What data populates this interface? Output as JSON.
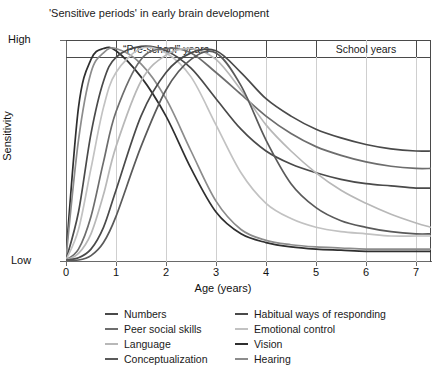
{
  "title": "'Sensitive periods' in early brain development",
  "axes": {
    "x_title": "Age (years)",
    "y_title": "Sensitivity",
    "y_high_label": "High",
    "y_low_label": "Low",
    "x_ticks": [
      "0",
      "1",
      "2",
      "3",
      "4",
      "5",
      "6",
      "7"
    ]
  },
  "bands": [
    {
      "label": "“Pre-school” years",
      "start": 1,
      "end": 3
    },
    {
      "label": "School years",
      "start": 5,
      "end": 7
    }
  ],
  "legend": {
    "left": [
      {
        "label": "Numbers",
        "color": "#4a4a4a"
      },
      {
        "label": "Peer social skills",
        "color": "#6d6d6d"
      },
      {
        "label": "Language",
        "color": "#b8b8b8"
      },
      {
        "label": "Conceptualization",
        "color": "#5a5a5a"
      }
    ],
    "right": [
      {
        "label": "Habitual ways of responding",
        "color": "#4a4a4a"
      },
      {
        "label": "Emotional control",
        "color": "#c2c2c2"
      },
      {
        "label": "Vision",
        "color": "#2f2f2f"
      },
      {
        "label": "Hearing",
        "color": "#8c8c8c"
      }
    ]
  },
  "chart_data": {
    "type": "line",
    "title": "'Sensitive periods' in early brain development",
    "xlabel": "Age (years)",
    "ylabel": "Sensitivity",
    "xlim": [
      0,
      7.3
    ],
    "ylim": [
      0,
      1
    ],
    "x_ticks": [
      0,
      1,
      2,
      3,
      4,
      5,
      6,
      7
    ],
    "y_ticks": [
      0,
      1
    ],
    "y_tick_labels": [
      "Low",
      "High"
    ],
    "grid": "vertical",
    "legend_position": "below-plot",
    "annotations": [
      {
        "text": "“Pre-school” years",
        "x_range": [
          1,
          3
        ],
        "y": 1.0
      },
      {
        "text": "School years",
        "x_range": [
          5,
          7
        ],
        "y": 1.0
      }
    ],
    "x": [
      0,
      0.25,
      0.5,
      0.75,
      1,
      1.5,
      2,
      2.5,
      3,
      3.5,
      4,
      4.5,
      5,
      5.5,
      6,
      6.5,
      7,
      7.3
    ],
    "series": [
      {
        "name": "Vision",
        "color": "#2f2f2f",
        "values": [
          0.02,
          0.7,
          0.92,
          0.97,
          0.96,
          0.84,
          0.66,
          0.42,
          0.22,
          0.12,
          0.08,
          0.06,
          0.05,
          0.045,
          0.04,
          0.04,
          0.04,
          0.04
        ]
      },
      {
        "name": "Hearing",
        "color": "#8c8c8c",
        "values": [
          0.01,
          0.55,
          0.86,
          0.95,
          0.97,
          0.9,
          0.74,
          0.5,
          0.27,
          0.14,
          0.09,
          0.07,
          0.06,
          0.055,
          0.05,
          0.05,
          0.05,
          0.05
        ]
      },
      {
        "name": "Habitual ways of responding",
        "color": "#4a4a4a",
        "values": [
          0.0,
          0.22,
          0.58,
          0.82,
          0.93,
          0.98,
          0.96,
          0.88,
          0.74,
          0.6,
          0.5,
          0.44,
          0.4,
          0.37,
          0.35,
          0.34,
          0.33,
          0.33
        ]
      },
      {
        "name": "Emotional control",
        "color": "#c2c2c2",
        "values": [
          0.0,
          0.14,
          0.42,
          0.7,
          0.86,
          0.97,
          0.95,
          0.84,
          0.62,
          0.4,
          0.26,
          0.19,
          0.15,
          0.13,
          0.12,
          0.11,
          0.11,
          0.11
        ]
      },
      {
        "name": "Peer social skills",
        "color": "#6d6d6d",
        "values": [
          0.0,
          0.05,
          0.2,
          0.45,
          0.68,
          0.92,
          0.97,
          0.95,
          0.86,
          0.76,
          0.66,
          0.58,
          0.52,
          0.48,
          0.45,
          0.43,
          0.42,
          0.42
        ]
      },
      {
        "name": "Language",
        "color": "#b8b8b8",
        "values": [
          0.0,
          0.03,
          0.12,
          0.3,
          0.52,
          0.82,
          0.94,
          0.97,
          0.92,
          0.78,
          0.62,
          0.5,
          0.4,
          0.32,
          0.26,
          0.21,
          0.17,
          0.15
        ]
      },
      {
        "name": "Numbers",
        "color": "#4a4a4a",
        "values": [
          0.0,
          0.01,
          0.05,
          0.15,
          0.32,
          0.66,
          0.86,
          0.95,
          0.96,
          0.86,
          0.74,
          0.66,
          0.6,
          0.56,
          0.53,
          0.51,
          0.5,
          0.5
        ]
      },
      {
        "name": "Conceptualization",
        "color": "#5a5a5a",
        "values": [
          0.0,
          0.0,
          0.02,
          0.08,
          0.2,
          0.52,
          0.78,
          0.92,
          0.95,
          0.8,
          0.55,
          0.35,
          0.24,
          0.18,
          0.15,
          0.13,
          0.12,
          0.12
        ]
      }
    ]
  }
}
